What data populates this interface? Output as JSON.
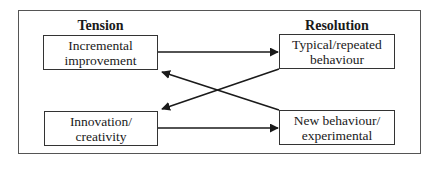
{
  "diagram": {
    "headings": {
      "left": "Tension",
      "right": "Resolution"
    },
    "boxes": [
      {
        "id": "incremental",
        "lines": [
          "Incremental",
          "improvement"
        ]
      },
      {
        "id": "typical",
        "lines": [
          "Typical/repeated",
          "behaviour"
        ]
      },
      {
        "id": "innovation",
        "lines": [
          "Innovation/",
          "creativity"
        ]
      },
      {
        "id": "new-behaviour",
        "lines": [
          "New behaviour/",
          "experimental"
        ]
      }
    ],
    "arrows": [
      {
        "from": "incremental",
        "to": "typical"
      },
      {
        "from": "innovation",
        "to": "new-behaviour"
      },
      {
        "from": "new-behaviour",
        "to": "incremental"
      },
      {
        "from": "typical",
        "to": "innovation"
      }
    ],
    "colors": {
      "line": "#1a1a1a",
      "frame": "#555555",
      "background": "#ffffff"
    }
  }
}
